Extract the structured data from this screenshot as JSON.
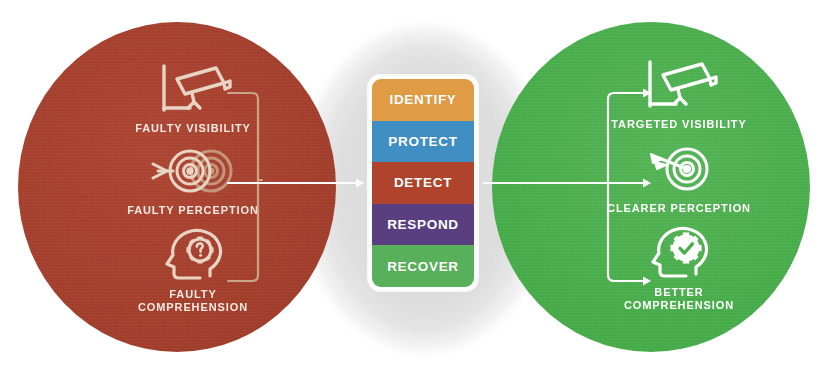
{
  "diagram": {
    "colors": {
      "red_circle": "#A3402E",
      "green_circle": "#4AAD4C",
      "identify": "#E09B45",
      "protect": "#3F8FC4",
      "detect": "#B0432C",
      "respond": "#5A3F80",
      "recover": "#58B05A",
      "red_icon_stroke": "#E8D5C4",
      "green_icon_stroke": "#FFFFFF",
      "halo": "#E6E6E6"
    }
  },
  "left_circle": {
    "name": "faulty-state",
    "items": [
      {
        "icon": "cctv-camera-faulty-icon",
        "label": "FAULTY VISIBILITY"
      },
      {
        "icon": "blurred-target-icon",
        "label": "FAULTY PERCEPTION"
      },
      {
        "icon": "head-gear-question-icon",
        "label": "FAULTY\nCOMPREHENSION"
      }
    ]
  },
  "center_stack": {
    "name": "nist-csf-functions",
    "bands": [
      {
        "label": "IDENTIFY",
        "color": "#E09B45"
      },
      {
        "label": "PROTECT",
        "color": "#3F8FC4"
      },
      {
        "label": "DETECT",
        "color": "#B0432C"
      },
      {
        "label": "RESPOND",
        "color": "#5A3F80"
      },
      {
        "label": "RECOVER",
        "color": "#58B05A"
      }
    ]
  },
  "right_circle": {
    "name": "improved-state",
    "items": [
      {
        "icon": "cctv-camera-clear-icon",
        "label": "TARGETED VISIBILITY"
      },
      {
        "icon": "target-dart-icon",
        "label": "CLEARER PERCEPTION"
      },
      {
        "icon": "head-gear-check-icon",
        "label": "BETTER\nCOMPREHENSION"
      }
    ]
  }
}
